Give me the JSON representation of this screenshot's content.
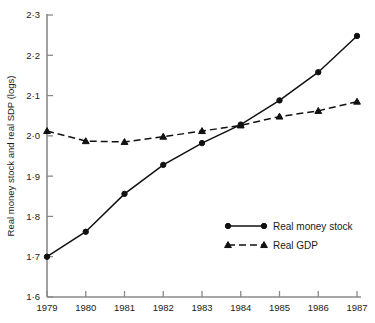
{
  "chart_data": {
    "type": "line",
    "title": "",
    "xlabel": "",
    "ylabel": "Real money stock and real SDP (logs)",
    "x": [
      1979,
      1980,
      1981,
      1982,
      1983,
      1984,
      1985,
      1986,
      1987
    ],
    "xticklabels": [
      "1979",
      "1980",
      "1981",
      "1982",
      "1983",
      "1984",
      "1985",
      "1986",
      "1987"
    ],
    "xlim": [
      1979,
      1987
    ],
    "ylim": [
      1.6,
      2.3
    ],
    "yticks": [
      1.6,
      1.7,
      1.8,
      1.9,
      2.0,
      2.1,
      2.2,
      2.3
    ],
    "yticklabels": [
      "1·6",
      "1·7",
      "1·8",
      "1·9",
      "2·0",
      "2·1",
      "2·2",
      "2·3"
    ],
    "grid": false,
    "legend_position": "inside lower-right",
    "series": [
      {
        "name": "Real money stock",
        "marker": "circle",
        "linestyle": "solid",
        "color": "#111111",
        "values": [
          1.7,
          1.762,
          1.856,
          1.928,
          1.982,
          2.028,
          2.088,
          2.158,
          2.248
        ]
      },
      {
        "name": "Real GDP",
        "marker": "triangle",
        "linestyle": "dashed",
        "color": "#111111",
        "values": [
          2.012,
          1.987,
          1.985,
          1.998,
          2.012,
          2.026,
          2.048,
          2.062,
          2.085
        ]
      }
    ]
  },
  "legend": {
    "items": [
      {
        "label": "Real money stock"
      },
      {
        "label": "Real GDP"
      }
    ]
  },
  "axes": {
    "y_axis_title": "Real money stock and real SDP (logs)"
  }
}
